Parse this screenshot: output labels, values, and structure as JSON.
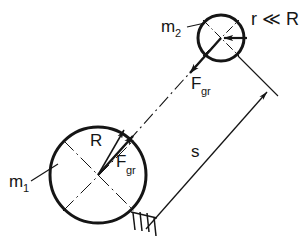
{
  "figure": {
    "kind": "physics-diagram",
    "background_color": "#ffffff",
    "ink_color": "#151515"
  },
  "labels": {
    "mass_large": {
      "base": "m",
      "subscript": "1",
      "text": "m1"
    },
    "mass_small": {
      "base": "m",
      "subscript": "2",
      "text": "m2"
    },
    "radius_large": {
      "text": "R"
    },
    "radius_relation": {
      "text": "r ≪ R"
    },
    "force_large": {
      "base": "F",
      "subscript": "gr",
      "text": "Fgr"
    },
    "force_small": {
      "base": "F",
      "subscript": "gr",
      "text": "Fgr"
    },
    "distance": {
      "text": "s"
    }
  },
  "geometry": {
    "large_body": {
      "name": "m1",
      "center_x": 98,
      "center_y": 175,
      "radius": 48,
      "stroke_width": 3
    },
    "small_body": {
      "name": "m2",
      "center_x": 221,
      "center_y": 38,
      "radius": 23,
      "stroke_width": 3
    },
    "centerline": {
      "from_x": 98,
      "from_y": 175,
      "to_x": 221,
      "to_y": 38,
      "style": "dash-dot"
    },
    "distance_dimension": {
      "from_x": 145,
      "from_y": 228,
      "to_x": 265,
      "to_y": 91,
      "label": "s"
    }
  },
  "arrows": {
    "force_on_m1": {
      "label": "Fgr",
      "direction": "toward-m2",
      "tail_x": 98,
      "tail_y": 175,
      "tip_x": 132,
      "tip_y": 137
    },
    "force_on_m2": {
      "label": "Fgr",
      "direction": "toward-m1",
      "tail_x": 221,
      "tail_y": 38,
      "tip_x": 191,
      "tip_y": 72
    },
    "radius_R": {
      "label": "R",
      "tail_x": 98,
      "tail_y": 175,
      "tip_x": 123,
      "tip_y": 131
    },
    "radius_r": {
      "label": "r",
      "tail_x": 246,
      "tail_y": 38,
      "tip_x": 223,
      "tip_y": 38
    }
  },
  "annotations": {
    "hatching": {
      "name": "reference-hatching",
      "stroke_count": 4,
      "at_x": 143,
      "at_y": 222
    },
    "leader_m1": {
      "from_x": 30,
      "from_y": 180,
      "to_x": 56,
      "to_y": 166
    },
    "leader_m2": {
      "from_x": 186,
      "from_y": 27,
      "to_x": 203,
      "to_y": 24
    }
  }
}
